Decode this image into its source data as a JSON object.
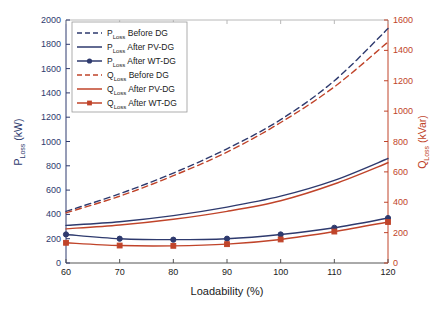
{
  "chart_data": {
    "type": "line",
    "title": "",
    "xlabel": "Loadability (%)",
    "ylabel": "P_Loss (kW)",
    "y2label": "Q_Loss (kVar)",
    "x": [
      60,
      70,
      80,
      90,
      100,
      110,
      120
    ],
    "xlim": [
      60,
      120
    ],
    "xticks": [
      60,
      70,
      80,
      90,
      100,
      110,
      120
    ],
    "ylim": [
      0,
      2000
    ],
    "yticks": [
      0,
      200,
      400,
      600,
      800,
      1000,
      1200,
      1400,
      1600,
      1800,
      2000
    ],
    "y2lim": [
      0,
      1600
    ],
    "y2ticks": [
      0,
      200,
      400,
      600,
      800,
      1000,
      1200,
      1400,
      1600
    ],
    "grid": false,
    "legend_position": "upper-left",
    "series": [
      {
        "name": "P_Loss Before DG",
        "label_main": "P",
        "label_sub": "Loss",
        "label_tail": "Before DG",
        "axis": "left",
        "color": "#2e3a6e",
        "style": "dashed",
        "marker": "none",
        "values": [
          425,
          570,
          740,
          940,
          1180,
          1500,
          1930
        ]
      },
      {
        "name": "P_Loss After PV-DG",
        "label_main": "P",
        "label_sub": "Loss",
        "label_tail": "After PV-DG",
        "axis": "left",
        "color": "#2e3a6e",
        "style": "solid",
        "marker": "none",
        "values": [
          310,
          340,
          390,
          460,
          550,
          680,
          860
        ]
      },
      {
        "name": "P_Loss After WT-DG",
        "label_main": "P",
        "label_sub": "Loss",
        "label_tail": "After WT-DG",
        "axis": "left",
        "color": "#2e3a6e",
        "style": "solid",
        "marker": "circle",
        "values": [
          235,
          200,
          192,
          200,
          235,
          290,
          370
        ]
      },
      {
        "name": "Q_Loss Before DG",
        "label_main": "Q",
        "label_sub": "Loss",
        "label_tail": "Before DG",
        "axis": "right",
        "color": "#c0442a",
        "style": "dashed",
        "marker": "none",
        "values": [
          330,
          440,
          575,
          730,
          925,
          1160,
          1455
        ]
      },
      {
        "name": "Q_Loss After PV-DG",
        "label_main": "Q",
        "label_sub": "Loss",
        "label_tail": "After PV-DG",
        "axis": "right",
        "color": "#c0442a",
        "style": "solid",
        "marker": "none",
        "values": [
          225,
          250,
          288,
          340,
          410,
          520,
          660
        ]
      },
      {
        "name": "Q_Loss After WT-DG",
        "label_main": "Q",
        "label_sub": "Loss",
        "label_tail": "After WT-DG",
        "axis": "right",
        "color": "#c0442a",
        "style": "solid",
        "marker": "square",
        "values": [
          133,
          115,
          113,
          124,
          155,
          207,
          270
        ]
      }
    ]
  },
  "axes": {
    "x_label": "Loadability (%)",
    "y_left_main": "P",
    "y_left_sub": "Loss",
    "y_left_unit": " (kW)",
    "y_right_main": "Q",
    "y_right_sub": "Loss",
    "y_right_unit": " (kVar)",
    "x_ticks": [
      "60",
      "70",
      "80",
      "90",
      "100",
      "110",
      "120"
    ],
    "y_left_ticks": [
      "0",
      "200",
      "400",
      "600",
      "800",
      "1000",
      "1200",
      "1400",
      "1600",
      "1800",
      "2000"
    ],
    "y_right_ticks": [
      "0",
      "200",
      "400",
      "600",
      "800",
      "1000",
      "1200",
      "1400",
      "1600"
    ]
  },
  "colors": {
    "blue": "#2e3a6e",
    "red": "#c0442a",
    "axis_left": "#2e3a6e",
    "axis_right": "#c0442a",
    "frame": "#b8b8b8",
    "background": "#ffffff"
  },
  "legend": {
    "entries": [
      {
        "main": "P",
        "sub": "Loss",
        "tail": "Before DG",
        "color": "#2e3a6e",
        "style": "dashed",
        "marker": "none"
      },
      {
        "main": "P",
        "sub": "Loss",
        "tail": "After PV-DG",
        "color": "#2e3a6e",
        "style": "solid",
        "marker": "none"
      },
      {
        "main": "P",
        "sub": "Loss",
        "tail": "After WT-DG",
        "color": "#2e3a6e",
        "style": "solid",
        "marker": "circle"
      },
      {
        "main": "Q",
        "sub": "Loss",
        "tail": "Before DG",
        "color": "#c0442a",
        "style": "dashed",
        "marker": "none"
      },
      {
        "main": "Q",
        "sub": "Loss",
        "tail": "After PV-DG",
        "color": "#c0442a",
        "style": "solid",
        "marker": "none"
      },
      {
        "main": "Q",
        "sub": "Loss",
        "tail": "After WT-DG",
        "color": "#c0442a",
        "style": "solid",
        "marker": "square"
      }
    ]
  }
}
